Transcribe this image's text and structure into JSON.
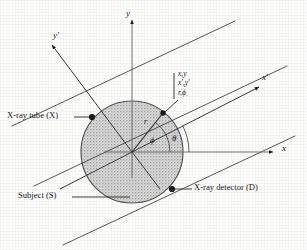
{
  "figure": {
    "background_color": "#fdfdfc",
    "ink_color": "#1a1a1a",
    "subject_fill": "#d8d8d8",
    "subject_stroke": "#4a4a4a"
  },
  "axes": {
    "x_label": "x",
    "y_label": "y",
    "x_prime_label": "x′",
    "y_prime_label": "y′"
  },
  "angles": {
    "phi_label": "ϕ",
    "theta_label": "θ"
  },
  "point": {
    "radius_label": "r",
    "coordinates": [
      "x,y",
      "x′,y′",
      "r,ϕ"
    ]
  },
  "annotations": {
    "tube_label": "X-ray tube (X)",
    "subject_label": "Subject (S)",
    "detector_label": "X-ray detector (D)"
  },
  "geometry": {
    "center": {
      "x": 132,
      "y": 152
    },
    "subject_radius": 51,
    "theta_degrees": 27,
    "phi_degrees": 52,
    "point_r_fraction": 0.62,
    "beam_count": 3
  }
}
